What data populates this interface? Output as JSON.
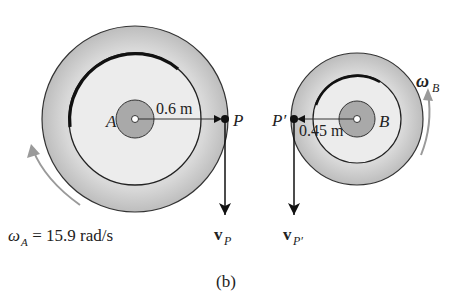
{
  "figure": {
    "caption": "(b)",
    "gear_a": {
      "center_label": "A",
      "radius_label": "0.6 m",
      "point_label": "P",
      "velocity_label": "v",
      "velocity_subscript": "P",
      "omega_symbol": "ω",
      "omega_subscript": "A",
      "omega_value": " = 15.9 rad/s"
    },
    "gear_b": {
      "center_label": "B",
      "radius_label": "0.45 m",
      "point_label": "P′",
      "velocity_label": "v",
      "velocity_subscript": "P′",
      "omega_symbol": "ω",
      "omega_subscript": "B"
    },
    "colors": {
      "rim": "#c8c8c8",
      "face": "#ededed",
      "hub": "#a9a9a9",
      "stroke": "#222222",
      "arrow_gray": "#9a9a9a"
    }
  }
}
